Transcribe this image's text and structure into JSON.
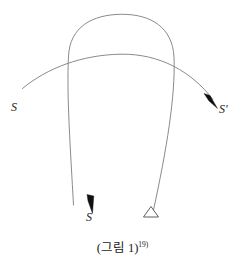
{
  "figure": {
    "caption_text": "(그림 1)",
    "caption_footnote": "19)",
    "background_color": "#ffffff",
    "curve_color": "#7d7d7d",
    "arrow_color": "#111111",
    "triangle_color": "#5f5f5f"
  },
  "labels": {
    "source": "S",
    "target": "S'",
    "bottom": "S"
  },
  "shapes": {
    "wide_arc_label": "shallow-arc-left-to-right",
    "arch_label": "tall-inverted-u-curve",
    "triangle_label": "ground-triangle-marker"
  }
}
